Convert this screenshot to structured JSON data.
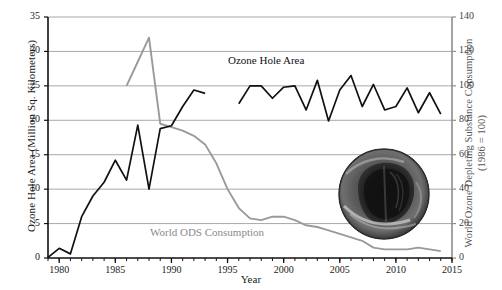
{
  "chart_data": {
    "type": "line",
    "title": "",
    "xlabel": "Year",
    "ylabel": "Ozone Hole Area (Million Sq. Kilometers)",
    "ylabel_right": "World Ozone Depleting Substance Consumption",
    "ylabel_right_sub": "(1986 = 100)",
    "xlim": [
      1979,
      2015
    ],
    "ylim": [
      0,
      35
    ],
    "ylim_right": [
      0,
      140
    ],
    "grid": true,
    "legend_position": "inline-annotations",
    "xticks": [
      1980,
      1985,
      1990,
      1995,
      2000,
      2005,
      2010,
      2015
    ],
    "xtick_labels": [
      "1980",
      "1985",
      "1990",
      "1995",
      "2000",
      "2005",
      "2010",
      "2015"
    ],
    "x_minor_tick_interval": 1,
    "yticks_left": [
      0,
      5,
      10,
      15,
      20,
      25,
      30,
      35
    ],
    "ytick_labels_left": [
      "0",
      "5",
      "10",
      "15",
      "20",
      "25",
      "30",
      "35"
    ],
    "yticks_right": [
      0,
      20,
      40,
      60,
      80,
      100,
      120,
      140
    ],
    "ytick_labels_right": [
      "0",
      "20",
      "40",
      "60",
      "80",
      "100",
      "120",
      "140"
    ],
    "series": [
      {
        "name": "Ozone Hole Area",
        "axis": "left",
        "color": "#111111",
        "units": "Million Sq. Kilometers",
        "x": [
          1979,
          1980,
          1981,
          1982,
          1983,
          1984,
          1985,
          1986,
          1987,
          1988,
          1989,
          1990,
          1991,
          1992,
          1993,
          1996,
          1997,
          1998,
          1999,
          2000,
          2001,
          2002,
          2003,
          2004,
          2005,
          2006,
          2007,
          2008,
          2009,
          2010,
          2011,
          2012,
          2013,
          2014
        ],
        "values": [
          0.1,
          1.4,
          0.6,
          6.0,
          9.0,
          11.0,
          14.2,
          11.3,
          19.3,
          10.0,
          18.8,
          19.2,
          22.0,
          24.4,
          23.9,
          22.4,
          25.0,
          25.0,
          23.2,
          24.8,
          25.0,
          21.5,
          25.8,
          19.9,
          24.4,
          26.5,
          22.0,
          25.2,
          21.5,
          22.0,
          24.7,
          21.1,
          24.0,
          20.9
        ]
      },
      {
        "name": "World ODS Consumption",
        "axis": "right",
        "color": "#9a9a9a",
        "units": "index (1986 = 100)",
        "x": [
          1986,
          1987,
          1988,
          1989,
          1990,
          1991,
          1992,
          1993,
          1994,
          1995,
          1996,
          1997,
          1998,
          1999,
          2000,
          2001,
          2002,
          2003,
          2004,
          2005,
          2006,
          2007,
          2008,
          2009,
          2010,
          2011,
          2012,
          2013,
          2014
        ],
        "values": [
          100,
          114,
          128,
          78,
          76,
          74,
          71,
          66,
          55,
          40,
          29,
          23,
          22,
          24,
          24,
          22,
          19,
          18,
          16,
          14,
          12,
          10,
          6,
          5,
          5,
          5,
          6,
          5,
          4
        ]
      }
    ],
    "annotations": [
      {
        "name": "ozone-hole-area-label",
        "text": "Ozone Hole Area",
        "color": "#111111"
      },
      {
        "name": "world-ods-consumption-label",
        "text": "World ODS Consumption",
        "color": "#8a8a8a"
      }
    ],
    "inset": {
      "name": "ozone-hole-satellite-image",
      "description": "Grayscale satellite image of the Antarctic ozone hole"
    }
  }
}
